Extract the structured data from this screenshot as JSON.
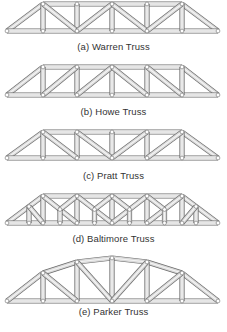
{
  "figure": {
    "colors": {
      "member_fill": "#d9d9d9",
      "member_highlight": "#f4f4f4",
      "member_edge": "#6b6b6b",
      "joint_fill": "#ffffff",
      "caption_text": "#333333"
    },
    "trusses": [
      {
        "id": "warren",
        "label": "(a) Warren Truss",
        "top": 4,
        "bottom": 31,
        "caption_y": 41,
        "nodes_x": [
          7,
          43,
          77,
          112,
          147,
          182,
          218
        ],
        "pattern": "warren"
      },
      {
        "id": "howe",
        "label": "(b) Howe Truss",
        "top": 67,
        "bottom": 95,
        "caption_y": 106,
        "nodes_x": [
          7,
          43,
          77,
          112,
          147,
          182,
          218
        ],
        "pattern": "howe"
      },
      {
        "id": "pratt",
        "label": "(c) Pratt Truss",
        "top": 132,
        "bottom": 158,
        "caption_y": 170,
        "nodes_x": [
          7,
          43,
          77,
          112,
          147,
          182,
          218
        ],
        "pattern": "pratt"
      },
      {
        "id": "baltimore",
        "label": "(d) Baltimore Truss",
        "top": 196,
        "bottom": 223,
        "caption_y": 233,
        "nodes_x": [
          7,
          43,
          77,
          112,
          147,
          182,
          218
        ],
        "pattern": "baltimore"
      },
      {
        "id": "parker",
        "label": "(e) Parker Truss",
        "top": 258,
        "bottom": 301,
        "caption_y": 306,
        "nodes_x": [
          7,
          43,
          77,
          112,
          147,
          182,
          218
        ],
        "top_y": [
          301,
          273,
          262,
          258,
          262,
          273,
          301
        ],
        "pattern": "parker"
      }
    ]
  }
}
